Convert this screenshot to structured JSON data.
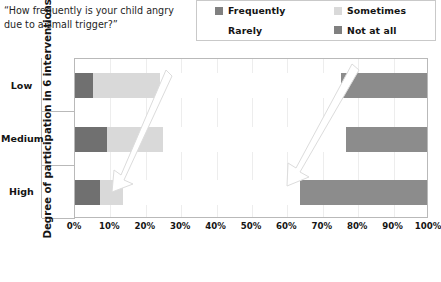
{
  "question": {
    "text": "“How frequently is your child angry\ndue to a small trigger?”"
  },
  "legend": {
    "position": "top-right",
    "items": [
      {
        "label": "Frequently",
        "color": "#808080"
      },
      {
        "label": "Sometimes",
        "color": "#d9d9d9"
      },
      {
        "label": "Rarely",
        "color": "#ffffff"
      },
      {
        "label": "Not at all",
        "color": "#808080"
      }
    ]
  },
  "axis": {
    "y_title": "Degree of participation in  6  interventions",
    "x_ticks": [
      "0%",
      "10%",
      "20%",
      "30%",
      "40%",
      "50%",
      "60%",
      "70%",
      "80%",
      "90%",
      "100%"
    ],
    "categories": [
      "Low",
      "Medium",
      "High"
    ]
  },
  "annotations": {
    "arrows": [
      {
        "name": "arrow-left",
        "from_x": 166,
        "from_y": 72,
        "to_x": 118,
        "to_y": 186
      },
      {
        "name": "arrow-right",
        "from_x": 352,
        "from_y": 68,
        "to_x": 290,
        "to_y": 178
      }
    ]
  },
  "chart_data": {
    "type": "bar",
    "orientation": "horizontal",
    "stacked": true,
    "normalized_to_percent": true,
    "title": "“How frequently is your child angry due to a small trigger?”",
    "xlabel": "",
    "ylabel": "Degree of participation in  6  interventions",
    "xlim": [
      0,
      100
    ],
    "xtick_labels": [
      "0%",
      "10%",
      "20%",
      "30%",
      "40%",
      "50%",
      "60%",
      "70%",
      "80%",
      "90%",
      "100%"
    ],
    "grid": "vertical-only",
    "legend_position": "top-right",
    "categories": [
      "Low",
      "Medium",
      "High"
    ],
    "series": [
      {
        "name": "Frequently",
        "color": "#707070",
        "values": [
          5,
          9,
          7
        ]
      },
      {
        "name": "Sometimes",
        "color": "#d9d9d9",
        "values": [
          19,
          16,
          6.5
        ]
      },
      {
        "name": "Rarely",
        "color": "#ffffff",
        "values": [
          51,
          51.5,
          50
        ]
      },
      {
        "name": "Not at all",
        "color": "#8c8c8c",
        "values": [
          25,
          23.5,
          36.5
        ]
      }
    ],
    "cumulative_boundaries": {
      "Low": [
        5,
        24,
        75,
        100
      ],
      "Medium": [
        9,
        25,
        76.5,
        100
      ],
      "High": [
        7,
        13.5,
        63.5,
        100
      ]
    }
  },
  "style": {
    "plot_border_color": "#b9b9b9",
    "gridline_color": "#ededed",
    "text_color": "#141414",
    "background": "#ffffff"
  }
}
